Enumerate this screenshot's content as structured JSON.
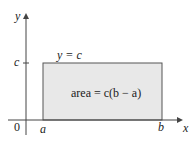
{
  "diagram": {
    "axis_x_label": "x",
    "axis_y_label": "y",
    "origin_label": "0",
    "a_label": "a",
    "b_label": "b",
    "c_label": "c",
    "line_label": "y = c",
    "area_label": "area = c(b − a)",
    "colors": {
      "fill": "#e8e8e8",
      "stroke": "#444444"
    }
  }
}
